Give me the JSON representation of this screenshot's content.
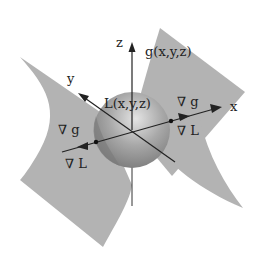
{
  "diagram": {
    "axes": {
      "x_label": "x",
      "y_label": "y",
      "z_label": "z"
    },
    "labels": {
      "surface": "g(x,y,z)",
      "sphere": "L(x,y,z)",
      "grad_g_right": "∇ g",
      "grad_L_right": "∇ L",
      "grad_g_left": "∇ g",
      "grad_L_left": "∇ L"
    },
    "colors": {
      "surface": "#b0b0b0",
      "sphere": "#9a9a9a",
      "axis": "#222222",
      "background": "#ffffff"
    }
  }
}
